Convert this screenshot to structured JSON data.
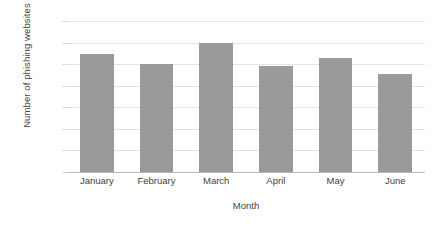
{
  "chart_data": {
    "type": "bar",
    "title": "",
    "xlabel": "Month",
    "ylabel": "Number of phishing websites",
    "categories": [
      "January",
      "February",
      "March",
      "April",
      "May",
      "June"
    ],
    "values": [
      54800,
      50000,
      60000,
      49300,
      52700,
      45500
    ],
    "series": [
      {
        "name": "Number of phishing websites",
        "values": [
          54800,
          50000,
          60000,
          49300,
          52700,
          45500
        ]
      }
    ],
    "ylim": [
      0,
      70000
    ],
    "ytick_values": [
      0,
      10000,
      20000,
      30000,
      40000,
      50000,
      60000,
      70000
    ],
    "ytick_labels": [
      "0",
      "10000",
      "20000",
      "30000",
      "40000",
      "50000",
      "60000",
      "70000"
    ],
    "grid": true,
    "grid_axis": "y",
    "legend": false,
    "legend_position": "none",
    "bar_color": "#9a9a9a",
    "gridline_color": "#e3e3e3",
    "axis_color": "#b9b9b9",
    "background_color": "#ffffff",
    "text_color": "#3f3f3f"
  }
}
